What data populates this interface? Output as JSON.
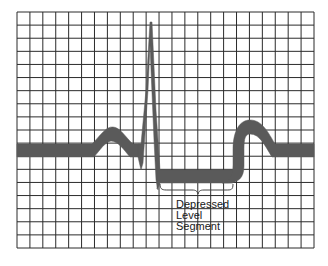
{
  "figure": {
    "annotation": {
      "lines": [
        "Depressed",
        "Level",
        "Segment"
      ]
    },
    "colors": {
      "background": "#ffffff",
      "grid": "#2b2b2b",
      "waveform": "#5a5a5a",
      "brace": "#444444",
      "text": "#1a1a1a"
    },
    "grid": {
      "columns": 23,
      "rows": 18
    },
    "waveform_features": [
      {
        "name": "baseline",
        "description": "isoelectric line"
      },
      {
        "name": "p-wave",
        "description": "small rounded bump"
      },
      {
        "name": "qrs-complex",
        "description": "tall narrow spike"
      },
      {
        "name": "st-segment",
        "description": "depressed level segment below baseline"
      },
      {
        "name": "t-wave",
        "description": "broad rounded wave"
      }
    ]
  }
}
